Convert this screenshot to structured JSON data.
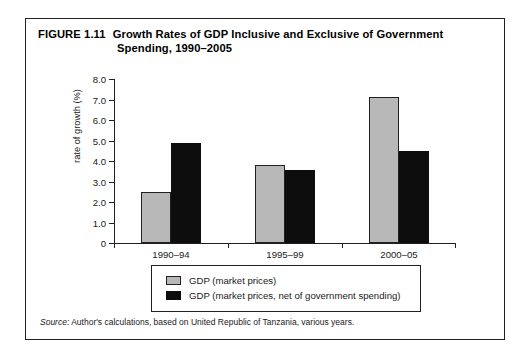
{
  "figure": {
    "number": "FIGURE 1.11",
    "title_line1": "Growth Rates of GDP Inclusive and Exclusive of Government",
    "title_line2": "Spending, 1990–2005",
    "source_label": "Source:",
    "source_text": " Author's calculations, based on United Republic of Tanzania, various years."
  },
  "legend": {
    "items": [
      {
        "label": "GDP (market prices)",
        "color": "#b8b8b8"
      },
      {
        "label": "GDP (market prices, net of government spending)",
        "color": "#0d0d0d"
      }
    ]
  },
  "chart_data": {
    "type": "bar",
    "title": "Growth Rates of GDP Inclusive and Exclusive of Government Spending, 1990–2005",
    "xlabel": "years",
    "ylabel": "rate of growth (%)",
    "categories": [
      "1990–94",
      "1995–99",
      "2000–05"
    ],
    "series": [
      {
        "name": "GDP (market prices)",
        "color": "#b8b8b8",
        "values": [
          2.5,
          3.8,
          7.1
        ]
      },
      {
        "name": "GDP (market prices, net of government spending)",
        "color": "#0d0d0d",
        "values": [
          4.9,
          3.55,
          4.5
        ]
      }
    ],
    "ylim": [
      0,
      8
    ],
    "ytick_step": 1,
    "ytick_labels": [
      "0",
      "1.0",
      "2.0",
      "3.0",
      "4.0",
      "5.0",
      "6.0",
      "7.0",
      "8.0"
    ],
    "grid": false,
    "legend_position": "below-plot"
  }
}
